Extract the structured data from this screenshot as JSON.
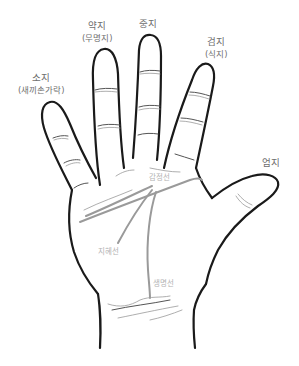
{
  "diagram": {
    "fingers": {
      "pinky": {
        "name": "소지",
        "alt": "(새끼손가락)"
      },
      "ring": {
        "name": "약지",
        "alt": "(무명지)"
      },
      "middle": {
        "name": "중지"
      },
      "index": {
        "name": "검지",
        "alt": "(식지)"
      },
      "thumb": {
        "name": "엄지"
      }
    },
    "palm_lines": {
      "heart": "감정선",
      "head": "지혜선",
      "life": "생명선"
    },
    "colors": {
      "outline": "#1a1a1a",
      "palm_line": "#9a9a9a",
      "label": "#6e6e6e",
      "line_label": "#b3b3b3"
    }
  }
}
